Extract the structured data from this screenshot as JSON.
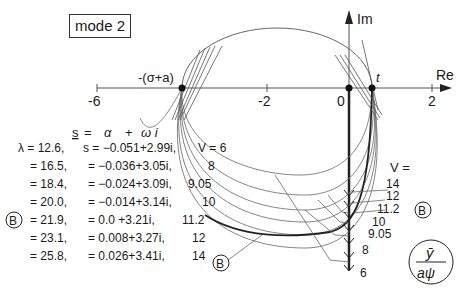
{
  "title": "mode 2",
  "axes": {
    "re_label": "Re",
    "im_label": "Im",
    "re_ticks": [
      "-6",
      "-2",
      "0",
      "2"
    ],
    "point_left_label": "-(σ+a)",
    "point_right_label": "t"
  },
  "formula": {
    "s_label": "s",
    "eq": "=",
    "alpha": "α",
    "plus": "+",
    "omega_i": "ω i"
  },
  "table": {
    "rows": [
      {
        "lam": "λ = 12.6,",
        "s": "s = −0.051+2.99i,",
        "v": "V = 6"
      },
      {
        "lam": "= 16.5,",
        "s": "= −0.036+3.05i,",
        "v": "8"
      },
      {
        "lam": "= 18.4,",
        "s": "= −0.024+3.09i,",
        "v": "9.05"
      },
      {
        "lam": "= 20.0,",
        "s": "= −0.014+3.14i,",
        "v": "10"
      },
      {
        "lam": "= 21.9,",
        "s": "=  0.0   +3.21i,",
        "v": "11.2",
        "marker": "B"
      },
      {
        "lam": "= 23.1,",
        "s": "=  0.008+3.27i,",
        "v": "12"
      },
      {
        "lam": "= 25.8,",
        "s": "=  0.026+3.41i,",
        "v": "14"
      }
    ]
  },
  "right_legend": {
    "header": "V =",
    "values": [
      "14",
      "12",
      "11.2",
      "10",
      "9.05",
      "8",
      "6"
    ],
    "marker": "B"
  },
  "marker_bottom": "B",
  "fraction": {
    "num": "ȳ",
    "den": "aψ"
  }
}
